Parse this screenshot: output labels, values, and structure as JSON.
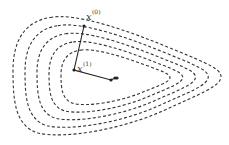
{
  "diagram": {
    "contour_count": 5,
    "colors": {
      "contour": "#333333",
      "path": "#222222"
    },
    "labels": [
      {
        "id": "x0",
        "base": "x",
        "superscript": "(0)"
      },
      {
        "id": "x1",
        "base": "x",
        "superscript": "(1)"
      }
    ],
    "iterates": [
      "x(0)",
      "x(1)",
      "x(2)",
      "x(3)",
      "x(4)"
    ]
  }
}
